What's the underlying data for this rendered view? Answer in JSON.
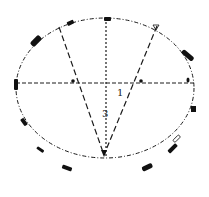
{
  "diagram": {
    "type": "technical-line-drawing",
    "colors": {
      "line": "#1a1a1a",
      "marker": "#111111",
      "background": "#ffffff"
    },
    "labels": [
      {
        "id": "label-1",
        "text": "1",
        "x": 117,
        "y": 96
      },
      {
        "id": "label-3",
        "text": "3",
        "x": 102,
        "y": 117
      }
    ],
    "ellipse": {
      "cx": 105,
      "cy": 97,
      "rx": 89,
      "ry": 79
    },
    "lines": {
      "horizontal": {
        "x1": 16,
        "y1": 83,
        "x2": 194,
        "y2": 83,
        "style": "dashed"
      },
      "vertical": {
        "x1": 106,
        "y1": 18,
        "x2": 106,
        "y2": 157,
        "style": "dotted"
      },
      "fan_left": {
        "x1": 59,
        "y1": 27,
        "x2": 104,
        "y2": 155,
        "style": "dashed"
      },
      "fan_right": {
        "x1": 157,
        "y1": 26,
        "x2": 104,
        "y2": 155,
        "style": "dashed"
      }
    },
    "markers": [
      {
        "name": "marker-top",
        "cx": 108,
        "cy": 19,
        "w": 7,
        "h": 4,
        "angle": 0
      },
      {
        "name": "marker-upper-left-small",
        "cx": 70,
        "cy": 23,
        "w": 7,
        "h": 4,
        "angle": -25
      },
      {
        "name": "marker-upper-left-large",
        "cx": 36,
        "cy": 41,
        "w": 12,
        "h": 6,
        "angle": -45
      },
      {
        "name": "marker-left",
        "cx": 16,
        "cy": 84,
        "w": 4,
        "h": 11,
        "angle": 0
      },
      {
        "name": "marker-upper-right",
        "cx": 188,
        "cy": 55,
        "w": 14,
        "h": 5,
        "angle": 40
      },
      {
        "name": "marker-right",
        "cx": 193,
        "cy": 109,
        "w": 5,
        "h": 6,
        "angle": 0
      },
      {
        "name": "marker-lower-left-1",
        "cx": 24,
        "cy": 122,
        "w": 8,
        "h": 4,
        "angle": 55
      },
      {
        "name": "marker-lower-left-2",
        "cx": 40,
        "cy": 150,
        "w": 8,
        "h": 3,
        "angle": 35
      },
      {
        "name": "marker-lower-left-3",
        "cx": 67,
        "cy": 168,
        "w": 10,
        "h": 4,
        "angle": 20
      },
      {
        "name": "marker-lower-right-1",
        "cx": 147,
        "cy": 168,
        "w": 11,
        "h": 5,
        "angle": -25
      },
      {
        "name": "marker-lower-right-2",
        "cx": 173,
        "cy": 148,
        "w": 11,
        "h": 4,
        "angle": -45
      },
      {
        "name": "marker-lower-right-3",
        "cx": 177,
        "cy": 139,
        "w": 8,
        "h": 3,
        "angle": -45
      }
    ],
    "points": [
      {
        "name": "apex-bottom",
        "cx": 104,
        "cy": 155
      },
      {
        "name": "point-left-intersection",
        "cx": 73,
        "cy": 81
      },
      {
        "name": "point-right-intersection",
        "cx": 141,
        "cy": 81
      },
      {
        "name": "point-right-end",
        "cx": 188,
        "cy": 80
      },
      {
        "name": "point-top-right",
        "cx": 156,
        "cy": 27
      }
    ]
  }
}
